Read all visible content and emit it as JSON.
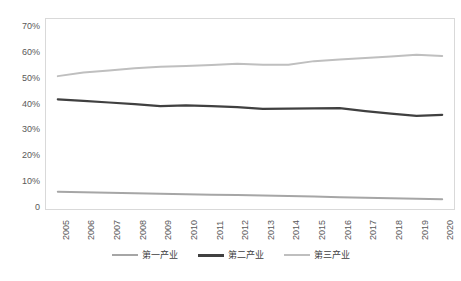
{
  "chart_data": {
    "type": "line",
    "title": "",
    "xlabel": "",
    "ylabel": "",
    "ylim": [
      0,
      0.7
    ],
    "grid": false,
    "legend_position": "bottom",
    "categories": [
      "2005",
      "2006",
      "2007",
      "2008",
      "2009",
      "2010",
      "2011",
      "2012",
      "2013",
      "2014",
      "2015",
      "2016",
      "2017",
      "2018",
      "2019",
      "2020"
    ],
    "y_ticks": [
      "0",
      "10%",
      "20%",
      "30%",
      "40%",
      "50%",
      "60%",
      "70%"
    ],
    "y_tick_values": [
      0,
      10,
      20,
      30,
      40,
      50,
      60,
      70
    ],
    "series": [
      {
        "name": "第一产业",
        "color": "#a6a6a6",
        "values": [
          6.3,
          6.1,
          5.9,
          5.7,
          5.5,
          5.3,
          5.1,
          5.0,
          4.8,
          4.6,
          4.4,
          4.2,
          4.0,
          3.8,
          3.6,
          3.4
        ]
      },
      {
        "name": "第二产业",
        "color": "#404040",
        "values": [
          42.0,
          41.4,
          40.8,
          40.2,
          39.4,
          39.7,
          39.4,
          39.0,
          38.3,
          38.4,
          38.5,
          38.6,
          37.5,
          36.5,
          35.6,
          36.0
        ]
      },
      {
        "name": "第三产业",
        "color": "#bfbfbf",
        "values": [
          51.0,
          52.4,
          53.2,
          54.0,
          54.6,
          54.9,
          55.3,
          55.8,
          55.4,
          55.4,
          56.8,
          57.4,
          58.0,
          58.6,
          59.3,
          58.8
        ]
      }
    ]
  },
  "legend": {
    "items": [
      {
        "label": "第一产业"
      },
      {
        "label": "第二产业"
      },
      {
        "label": "第三产业"
      }
    ]
  },
  "colors": {
    "primary_industry": "#a6a6a6",
    "secondary_industry": "#404040",
    "tertiary_industry": "#bfbfbf",
    "axis_text": "#595959",
    "plot_border": "#d9d9d9"
  }
}
